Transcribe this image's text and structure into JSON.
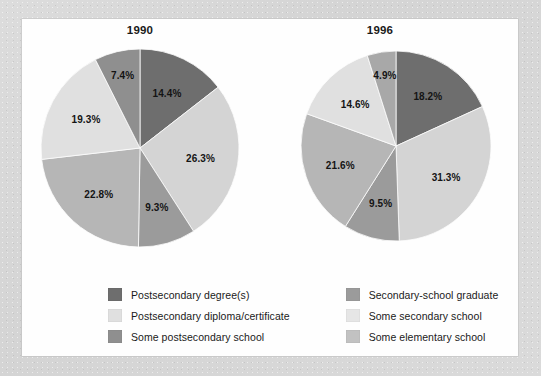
{
  "figure": {
    "background_color": "#d8d8d8",
    "panel_color": "#fefefe"
  },
  "chart_data": [
    {
      "type": "pie",
      "title": "1990",
      "categories": [
        "Postsecondary degree(s)",
        "Postsecondary diploma/certificate",
        "Secondary-school graduate",
        "Some postsecondary school",
        "Some secondary school",
        "Some elementary school"
      ],
      "values": [
        14.4,
        26.3,
        9.3,
        22.8,
        19.3,
        7.4
      ],
      "labels": [
        "14.4%",
        "26.3%",
        "9.3%",
        "22.8%",
        "19.3%",
        "7.4%"
      ],
      "colors": [
        "#6e6e6e",
        "#d4d4d4",
        "#9b9b9b",
        "#b6b6b6",
        "#e0e0e0",
        "#8f8f8f"
      ],
      "start_angle_deg": 0,
      "direction": "clockwise",
      "legend_position": "bottom"
    },
    {
      "type": "pie",
      "title": "1996",
      "categories": [
        "Postsecondary degree(s)",
        "Postsecondary diploma/certificate",
        "Secondary-school graduate",
        "Some postsecondary school",
        "Some secondary school",
        "Some elementary school"
      ],
      "values": [
        18.2,
        31.3,
        9.5,
        21.6,
        14.6,
        4.9
      ],
      "labels": [
        "18.2%",
        "31.3%",
        "9.5%",
        "21.6%",
        "14.6%",
        "4.9%"
      ],
      "colors": [
        "#6e6e6e",
        "#d4d4d4",
        "#9b9b9b",
        "#b6b6b6",
        "#e0e0e0",
        "#a8a8a8"
      ],
      "start_angle_deg": 0,
      "direction": "clockwise",
      "legend_position": "bottom"
    }
  ],
  "titles": {
    "left": "1990",
    "right": "1996"
  },
  "pie_1990": {
    "slices": [
      {
        "label": "14.4%",
        "value": 14.4,
        "color": "#6e6e6e",
        "category": "Postsecondary degree(s)"
      },
      {
        "label": "26.3%",
        "value": 26.3,
        "color": "#d4d4d4",
        "category": "Postsecondary diploma/certificate"
      },
      {
        "label": "9.3%",
        "value": 9.3,
        "color": "#9b9b9b",
        "category": "Secondary-school graduate"
      },
      {
        "label": "22.8%",
        "value": 22.8,
        "color": "#b6b6b6",
        "category": "Some postsecondary school"
      },
      {
        "label": "19.3%",
        "value": 19.3,
        "color": "#e0e0e0",
        "category": "Some secondary school"
      },
      {
        "label": "7.4%",
        "value": 7.4,
        "color": "#8f8f8f",
        "category": "Some elementary school"
      }
    ]
  },
  "pie_1996": {
    "slices": [
      {
        "label": "18.2%",
        "value": 18.2,
        "color": "#6e6e6e",
        "category": "Postsecondary degree(s)"
      },
      {
        "label": "31.3%",
        "value": 31.3,
        "color": "#d4d4d4",
        "category": "Postsecondary diploma/certificate"
      },
      {
        "label": "9.5%",
        "value": 9.5,
        "color": "#9b9b9b",
        "category": "Secondary-school graduate"
      },
      {
        "label": "21.6%",
        "value": 21.6,
        "color": "#b6b6b6",
        "category": "Some postsecondary school"
      },
      {
        "label": "14.6%",
        "value": 14.6,
        "color": "#e0e0e0",
        "category": "Some secondary school"
      },
      {
        "label": "4.9%",
        "value": 4.9,
        "color": "#a8a8a8",
        "category": "Some elementary school"
      }
    ]
  },
  "legend": {
    "columns": [
      {
        "items": [
          {
            "label": "Postsecondary degree(s)",
            "color": "#6e6e6e"
          },
          {
            "label": "Postsecondary diploma/certificate",
            "color": "#e0e0e0"
          },
          {
            "label": "Some postsecondary school",
            "color": "#8f8f8f"
          }
        ]
      },
      {
        "items": [
          {
            "label": "Secondary-school graduate",
            "color": "#9b9b9b"
          },
          {
            "label": "Some secondary school",
            "color": "#e6e6e6"
          },
          {
            "label": "Some elementary school",
            "color": "#c2c2c2"
          }
        ]
      }
    ]
  }
}
